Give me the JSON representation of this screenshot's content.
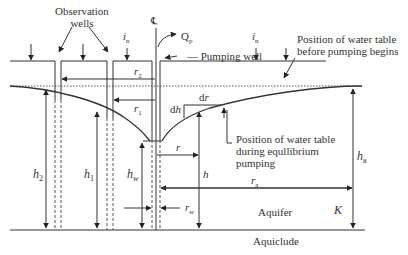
{
  "diagram": {
    "title": "",
    "labels": {
      "observation_wells": [
        "Observation",
        "wells"
      ],
      "centerline": "℄",
      "pumping_rate": {
        "base": "Q",
        "sub": "p"
      },
      "pumping_well": "Pumping well",
      "infiltration_left": {
        "base": "i",
        "sub": "n"
      },
      "infiltration_right": {
        "base": "i",
        "sub": "n"
      },
      "water_table_before": [
        "Position of water table",
        "before pumping begins"
      ],
      "water_table_during": [
        "Position of water table",
        "during equllibrium",
        "pumping"
      ],
      "r2": {
        "base": "r",
        "sub": "2"
      },
      "r1": {
        "base": "r",
        "sub": "1"
      },
      "dh": "dh",
      "dr": "dr",
      "r": "r",
      "h": "h",
      "h1": {
        "base": "h",
        "sub": "1"
      },
      "h2": {
        "base": "h",
        "sub": "2"
      },
      "hw": {
        "base": "h",
        "sub": "w"
      },
      "ha": {
        "base": "h",
        "sub": "a"
      },
      "ra": {
        "base": "r",
        "sub": "a"
      },
      "rw": {
        "base": "r",
        "sub": "w"
      },
      "K": "K",
      "aquifer": "Aquifer",
      "aquiclude": "Aquiclude"
    }
  }
}
